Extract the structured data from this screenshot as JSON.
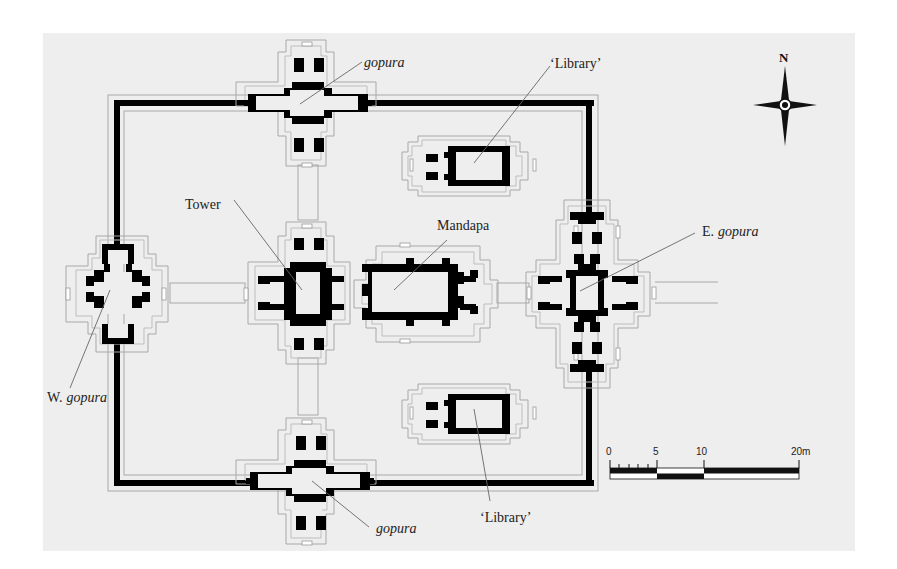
{
  "diagram": {
    "type": "architectural-floor-plan",
    "background_color": "#eeeeee",
    "wall_color": "#000000",
    "outline_color": "#a8a8a8",
    "labels": {
      "gopura_north": "gopura",
      "library_north": "‘Library’",
      "tower": "Tower",
      "mandapa": "Mandapa",
      "east_gopura_prefix": "E.",
      "east_gopura_suffix": "gopura",
      "west_gopura_prefix": "W.",
      "west_gopura_suffix": "gopura",
      "gopura_south": "gopura",
      "library_south": "‘Library’"
    },
    "compass": {
      "north_label": "N"
    },
    "scale_bar": {
      "ticks": [
        "0",
        "5",
        "10",
        "20m"
      ],
      "unit": "m"
    }
  }
}
